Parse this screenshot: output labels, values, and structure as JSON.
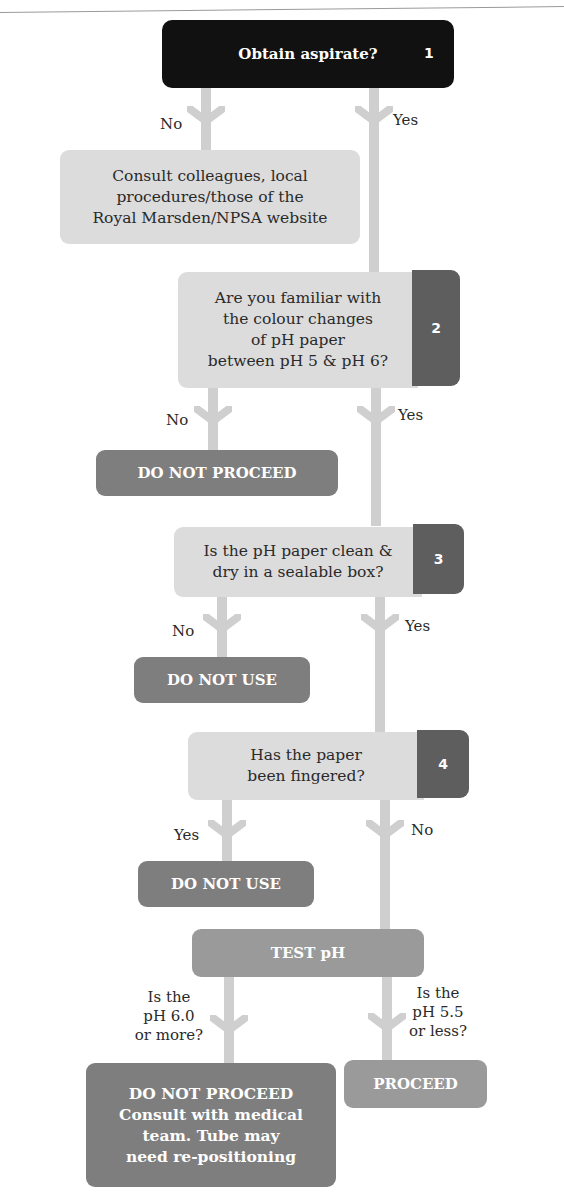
{
  "colors": {
    "start_box": "#111111",
    "question_box": "#dcdcdc",
    "step_tab": "#5e5e5e",
    "warning_box": "#7e7e7e",
    "test_box": "#9a9a9a",
    "connector": "#cfcfcf"
  },
  "steps": [
    {
      "number": "1",
      "question": "Obtain aspirate?",
      "left_branch": "No",
      "right_branch": "Yes"
    },
    {
      "number": "2",
      "question_lines": [
        "Are you familiar with",
        "the colour changes",
        "of pH paper",
        "between pH 5 & pH 6?"
      ],
      "left_branch": "No",
      "right_branch": "Yes"
    },
    {
      "number": "3",
      "question_lines": [
        "Is the pH paper clean &",
        "dry in a sealable box?"
      ],
      "left_branch": "No",
      "right_branch": "Yes"
    },
    {
      "number": "4",
      "question_lines": [
        "Has the paper",
        "been fingered?"
      ],
      "left_branch": "Yes",
      "right_branch": "No"
    }
  ],
  "outcomes": {
    "consult_lines": [
      "Consult colleagues, local",
      "procedures/those of the",
      "Royal Marsden/NPSA website"
    ],
    "step2_no": "DO NOT PROCEED",
    "step3_no": "DO NOT USE",
    "step4_yes": "DO NOT USE",
    "test": "TEST pH",
    "high_ph_label_lines": [
      "Is the",
      "pH 6.0",
      "or more?"
    ],
    "low_ph_label_lines": [
      "Is the",
      "pH 5.5",
      "or less?"
    ],
    "high_ph_result_lines": [
      "DO NOT PROCEED",
      "Consult with medical",
      "team. Tube may",
      "need re-positioning"
    ],
    "low_ph_result": "PROCEED"
  }
}
